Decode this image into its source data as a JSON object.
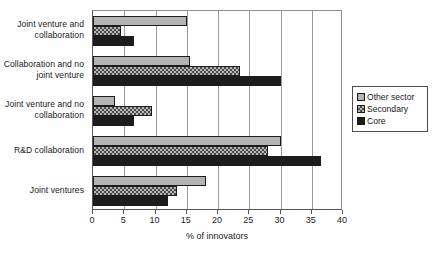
{
  "chart_data": {
    "type": "bar",
    "orientation": "horizontal",
    "title": "",
    "xlabel": "% of innovators",
    "ylabel": "",
    "xlim": [
      0,
      40
    ],
    "xticks": [
      0,
      5,
      10,
      15,
      20,
      25,
      30,
      35,
      40
    ],
    "grid": true,
    "legend_position": "right",
    "categories": [
      "Joint venture and collaboration",
      "Collaboration and no joint venture",
      "Joint venture and no collaboration",
      "R&D collaboration",
      "Joint ventures"
    ],
    "series": [
      {
        "name": "Other sector",
        "color": "#b3b3b3",
        "pattern": "solid-light-gray",
        "values": [
          15.0,
          15.5,
          3.5,
          30.0,
          18.0
        ]
      },
      {
        "name": "Secondary",
        "color": "#b8b8b8",
        "pattern": "checkered",
        "values": [
          4.5,
          23.5,
          9.5,
          28.0,
          13.5
        ]
      },
      {
        "name": "Core",
        "color": "#1c1c1c",
        "pattern": "solid-black",
        "values": [
          6.5,
          30.0,
          6.5,
          36.5,
          12.0
        ]
      }
    ]
  },
  "legend": {
    "items": [
      {
        "label": "Other sector"
      },
      {
        "label": "Secondary"
      },
      {
        "label": "Core"
      }
    ]
  }
}
